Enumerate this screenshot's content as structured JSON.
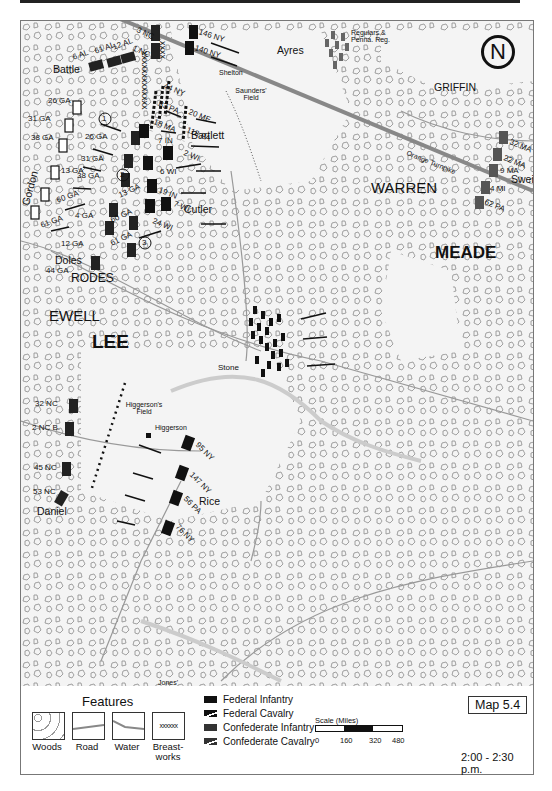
{
  "map": {
    "map_number": "Map 5.4",
    "time": "2:00 - 2:30  p.m.",
    "north_label": "N",
    "commanders": {
      "meade": "MEADE",
      "lee": "LEE",
      "ewell": "EWELL",
      "warren": "WARREN",
      "rodes": "RODES",
      "griffin": "GRIFFIN"
    },
    "brigades": {
      "battle": "Battle",
      "gordon": "Gordon",
      "doles": "Doles",
      "daniel": "Daniel",
      "bartlett": "Bartlett",
      "cutler": "Cutler",
      "ayres": "Ayres",
      "sweitzer": "Sweitzer",
      "stone": "Stone",
      "rice": "Rice",
      "shelton": "Shelton"
    },
    "places": {
      "saunders_field": "Saunders' Field",
      "higgersons_field": "Higgerson's Field",
      "higgerson": "Higgerson",
      "jones_field": "Jones' Field",
      "orange_turnpike": "Orange Turnpike",
      "regulars": "Regulars & Penna. Reg."
    },
    "markers": [
      "1",
      "2",
      "3"
    ],
    "confederate_units": [
      "3 NC",
      "1 NC",
      "12 AL",
      "61 AL",
      "6 AL",
      "26 GA",
      "31 GA",
      "38 GA",
      "13 GA",
      "60 GA",
      "61 GA",
      "4 GA",
      "12 GA",
      "44 GA",
      "32 NC",
      "2 NC B.",
      "45 NC",
      "53 NC"
    ],
    "confederate_units_inner": {
      "u26": "26 GA",
      "u31": "31 GA",
      "u38": "38 GA",
      "u13": "13 GA",
      "u60": "60 GA",
      "u61": "61 GA"
    },
    "federal_units": [
      "146 NY",
      "140 NY",
      "44 NY",
      "83 PA",
      "20 ME",
      "18 MA",
      "118 PA",
      "7 IN",
      "2 WI",
      "6 WI",
      "19 IN",
      "7 WI",
      "24 WI",
      "32 MA",
      "22 MA",
      "9 MA",
      "4 MI",
      "62 PA",
      "95 NY",
      "147 NY",
      "56 PA",
      "76 NY"
    ]
  },
  "legend": {
    "features_title": "Features",
    "features": [
      {
        "label": "Woods"
      },
      {
        "label": "Road"
      },
      {
        "label": "Water"
      },
      {
        "label": "Breast-works",
        "pattern": "xxxxxx"
      }
    ],
    "unit_keys": [
      {
        "label": "Federal Infantry",
        "color": "#111111"
      },
      {
        "label": "Federal Cavalry",
        "color": "#111111"
      },
      {
        "label": "Confederate Infantry",
        "color": "#333333"
      },
      {
        "label": "Confederate Cavalry",
        "color": "#333333"
      }
    ],
    "scale_title": "Scale (Miles)",
    "scale_ticks": [
      "0",
      "160",
      "320",
      "480"
    ]
  }
}
